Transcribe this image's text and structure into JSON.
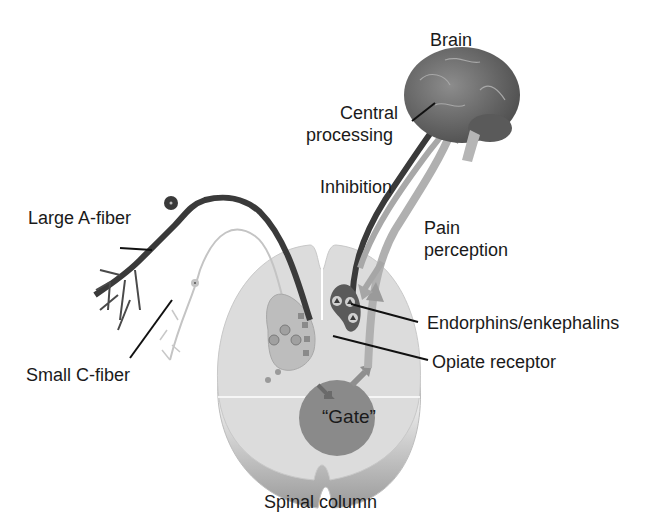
{
  "diagram": {
    "title_hint": "Gate control theory of pain",
    "labels": {
      "brain": "Brain",
      "central_processing_line1": "Central",
      "central_processing_line2": "processing",
      "inhibition": "Inhibition",
      "pain_perception_line1": "Pain",
      "pain_perception_line2": "perception",
      "large_a_fiber": "Large A-fiber",
      "small_c_fiber": "Small C-fiber",
      "endorphins": "Endorphins/enkephalins",
      "opiate_receptor": "Opiate receptor",
      "gate": "“Gate”",
      "spinal_column": "Spinal column"
    },
    "colors": {
      "background": "#ffffff",
      "text": "#1a1a1a",
      "brain": "#6f6f6f",
      "spinal_cord": "#d9d9d9",
      "gate": "#8a8a8a",
      "large_fiber": "#333333",
      "small_fiber": "#c4c4c4",
      "arrow": "#a6a6a6"
    }
  }
}
